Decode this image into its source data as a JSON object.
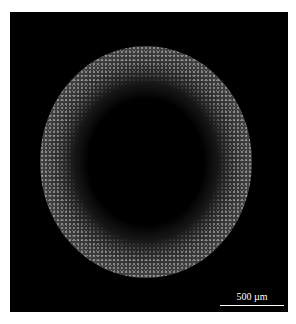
{
  "figure": {
    "background_color": "#000000",
    "scale_bar": {
      "label": "500 µm",
      "color": "#ffffff"
    }
  }
}
